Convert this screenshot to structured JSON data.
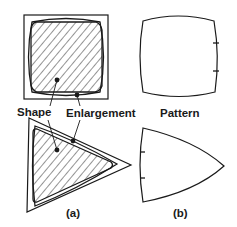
{
  "figure": {
    "labels": {
      "shape": "Shape",
      "enlargement": "Enlargement",
      "pattern": "Pattern",
      "panel_a": "(a)",
      "panel_b": "(b)"
    },
    "colors": {
      "stroke": "#1a1a1a",
      "hatch": "#2a2a2a",
      "background": "#ffffff"
    },
    "panels": [
      {
        "id": "a",
        "description": "Shape (hatched) with its enlargement inside a bounding outline, for a square and a triangle"
      },
      {
        "id": "b",
        "description": "Resulting pattern outlines with bulging edges and tick marks"
      }
    ]
  }
}
